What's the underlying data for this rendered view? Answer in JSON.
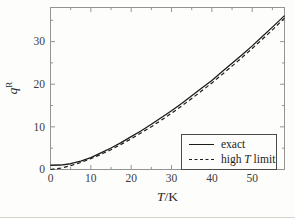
{
  "colors": {
    "curve": "#1c1c1c",
    "frame": "#949494",
    "tick": "#949494",
    "tick_label": "#3c3c3c",
    "background": "#fdfdfc"
  },
  "labels": {
    "xlabel_var": "T",
    "xlabel_unit": "/K",
    "ylabel_var": "q",
    "ylabel_sup": "R"
  },
  "legend": {
    "position": "lower right",
    "items": [
      {
        "pre": "exact",
        "var": "",
        "post": "",
        "style": "solid"
      },
      {
        "pre": "high ",
        "var": "T",
        "post": " limit",
        "style": "dashed"
      }
    ]
  },
  "chart_data": {
    "type": "line",
    "title": "",
    "xlabel": "T/K",
    "ylabel": "q^R",
    "xlim": [
      0,
      58
    ],
    "ylim": [
      0,
      38
    ],
    "xticks": [
      0,
      10,
      20,
      30,
      40,
      50
    ],
    "yticks": [
      0,
      10,
      20,
      30
    ],
    "minor_tick_step_x": 5,
    "minor_tick_step_y": 5,
    "grid": false,
    "legend_position": "lower right",
    "x": [
      0,
      2.5,
      5,
      7.5,
      10,
      12.5,
      15,
      17.5,
      20,
      22.5,
      25,
      27.5,
      30,
      32.5,
      35,
      37.5,
      40,
      42.5,
      45,
      47.5,
      50,
      52.5,
      55,
      58
    ],
    "series": [
      {
        "name": "exact",
        "line": "solid",
        "values": [
          1.0,
          1.05,
          1.35,
          1.95,
          2.8,
          3.9,
          5.05,
          6.3,
          7.7,
          9.1,
          10.6,
          12.2,
          13.8,
          15.5,
          17.3,
          19.1,
          20.9,
          22.9,
          24.9,
          26.9,
          29.0,
          31.2,
          33.4,
          36.1
        ]
      },
      {
        "name": "high T limit",
        "line": "dashed",
        "values": [
          0,
          0.32,
          0.9,
          1.65,
          2.55,
          3.55,
          4.65,
          5.9,
          7.2,
          8.6,
          10.05,
          11.6,
          13.2,
          14.9,
          16.65,
          18.45,
          20.3,
          22.25,
          24.25,
          26.3,
          28.4,
          30.55,
          32.75,
          35.5
        ]
      }
    ]
  }
}
